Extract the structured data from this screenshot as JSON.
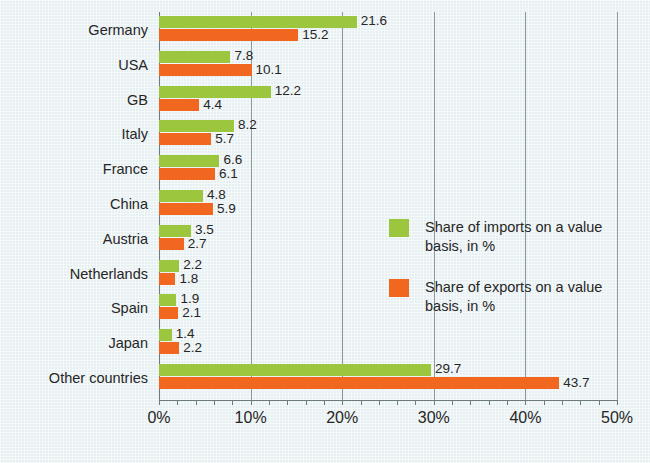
{
  "chart_data": {
    "type": "bar",
    "orientation": "horizontal",
    "title": "",
    "xlabel": "",
    "ylabel": "",
    "xlim": [
      0,
      50
    ],
    "xtick_labels": [
      "0%",
      "10%",
      "20%",
      "30%",
      "40%",
      "50%"
    ],
    "xtick_values": [
      0,
      10,
      20,
      30,
      40,
      50
    ],
    "grid": true,
    "legend_position": "center-right",
    "categories": [
      "Germany",
      "USA",
      "GB",
      "Italy",
      "France",
      "China",
      "Austria",
      "Netherlands",
      "Spain",
      "Japan",
      "Other countries"
    ],
    "series": [
      {
        "name": "Share of imports on a value basis, in %",
        "color": "#9cc63e",
        "values": [
          21.6,
          7.8,
          12.2,
          8.2,
          6.6,
          4.8,
          3.5,
          2.2,
          1.9,
          1.4,
          29.7
        ]
      },
      {
        "name": "Share of exports on a value basis, in %",
        "color": "#f2671f",
        "values": [
          15.2,
          10.1,
          4.4,
          5.7,
          6.1,
          5.9,
          2.7,
          1.8,
          2.1,
          2.2,
          43.7
        ]
      }
    ]
  },
  "legend": {
    "items": [
      {
        "label": "Share of imports on a value basis, in %",
        "swatch": "imports"
      },
      {
        "label": "Share of exports on a value basis, in %",
        "swatch": "exports"
      }
    ]
  },
  "colors": {
    "imports": "#9cc63e",
    "exports": "#f2671f",
    "background": "#e6eff1",
    "gridline": "#8c9aa0",
    "text": "#262626"
  }
}
